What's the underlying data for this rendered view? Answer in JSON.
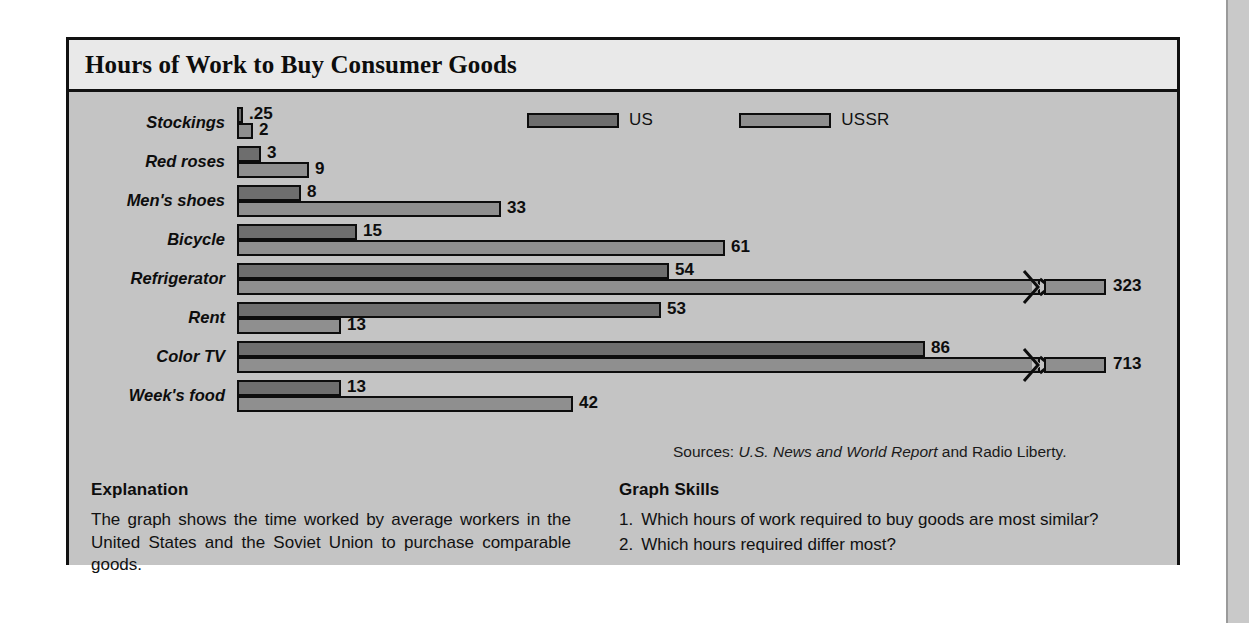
{
  "figure": {
    "title": "Hours of Work to Buy Consumer Goods",
    "sources_prefix": "Sources: ",
    "sources_italic": "U.S. News and World Report",
    "sources_suffix": " and Radio Liberty."
  },
  "legend": {
    "items": [
      {
        "label": "US",
        "color": "#6e6e6e",
        "swatch_name": "legend-swatch-us"
      },
      {
        "label": "USSR",
        "color": "#8f8f8f",
        "swatch_name": "legend-swatch-ussr"
      }
    ]
  },
  "explanation": {
    "heading": "Explanation",
    "body": "The graph shows the time worked by average workers in the United States and the Soviet Union to purchase comparable goods."
  },
  "skills": {
    "heading": "Graph Skills",
    "items": [
      {
        "num": "1.",
        "text": "Which hours of work required to buy goods are most similar?"
      },
      {
        "num": "2.",
        "text": "Which hours required differ most?"
      }
    ]
  },
  "chart_data": {
    "type": "bar",
    "orientation": "horizontal",
    "title": "Hours of Work to Buy Consumer Goods",
    "xlabel": "",
    "ylabel": "",
    "grid": false,
    "legend_position": "top-right",
    "value_unit": "hours of work",
    "axis_break_note": "US (Refrigerator) and USSR (Color TV) bars are drawn with a zigzag axis break because their values exceed the plot width.",
    "categories": [
      "Stockings",
      "Red roses",
      "Men's shoes",
      "Bicycle",
      "Refrigerator",
      "Rent",
      "Color TV",
      "Week's food"
    ],
    "series": [
      {
        "name": "US",
        "color": "#6e6e6e",
        "values": [
          0.25,
          3,
          8,
          15,
          54,
          53,
          86,
          13
        ],
        "labels": [
          ".25",
          "3",
          "8",
          "15",
          "54",
          "53",
          "86",
          "13"
        ]
      },
      {
        "name": "USSR",
        "color": "#8f8f8f",
        "values": [
          2,
          9,
          33,
          61,
          323,
          13,
          713,
          42
        ],
        "labels": [
          "2",
          "9",
          "33",
          "61",
          "323",
          "13",
          "713",
          "42"
        ]
      }
    ],
    "broken_bars": [
      {
        "category": "Refrigerator",
        "series": "USSR",
        "value": 323
      },
      {
        "category": "Color TV",
        "series": "USSR",
        "value": 713
      }
    ]
  }
}
